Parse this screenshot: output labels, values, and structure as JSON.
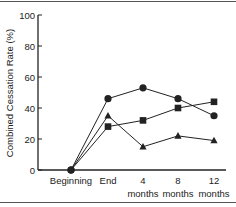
{
  "chart_data": {
    "type": "line",
    "title": "",
    "xlabel": "",
    "ylabel": "Combined Cessation Rate (%)",
    "ylim": [
      0,
      100
    ],
    "yticks": [
      0,
      20,
      40,
      60,
      80,
      100
    ],
    "grid": false,
    "legend": null,
    "categories": [
      "Beginning",
      "End",
      "4 months",
      "8 months",
      "12 months"
    ],
    "category_labels": [
      [
        "Beginning"
      ],
      [
        "End"
      ],
      [
        "4",
        "months"
      ],
      [
        "8",
        "months"
      ],
      [
        "12",
        "months"
      ]
    ],
    "series": [
      {
        "name": "circle",
        "marker": "circle",
        "values": [
          0,
          46,
          53,
          46,
          35
        ]
      },
      {
        "name": "square",
        "marker": "square",
        "values": [
          0,
          28,
          32,
          40,
          44
        ]
      },
      {
        "name": "triangle",
        "marker": "triangle",
        "values": [
          0,
          35,
          15,
          22,
          19
        ]
      }
    ]
  },
  "colors": {
    "line": "#222222",
    "axis": "#222222",
    "frame": "#555555"
  }
}
